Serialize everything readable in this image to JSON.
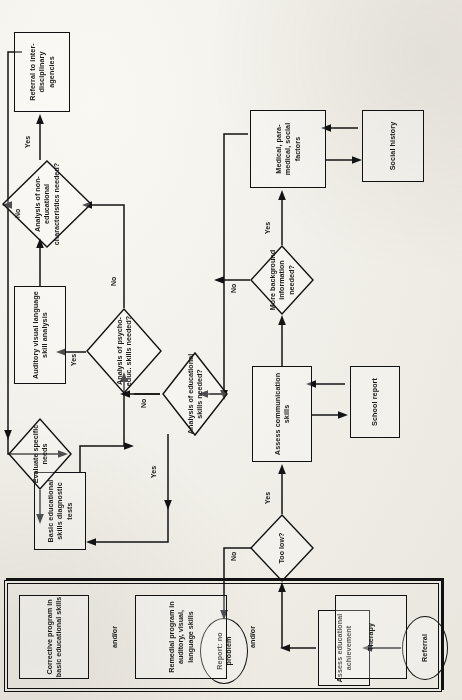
{
  "diagram": {
    "orientation": "rotated-90-ccw",
    "ink_color": "#131313",
    "paper_color": "#f1efe9",
    "nodes": {
      "referral": "Referral",
      "assess_educational_achievement": "Assess educational achievement",
      "too_low": "Too low?",
      "report_no_problem": "Report: no problem",
      "assess_communication_skills": "Assess communication skills",
      "school_report": "School report",
      "more_background_information": "More background information needed?",
      "medical_factors": "Medical, para-medical, social factors",
      "social_history": "Social history",
      "analysis_educational_skills": "Analysis of educational skills needed?",
      "basic_educational_tests": "Basic educational skills diagnostic tests",
      "analysis_psycho_educ": "Analysis of psycho-educ. skills needed?",
      "auditory_visual_language": "Auditory visual language skill analysis",
      "analysis_non_educational": "Analysis of non-educational characteristics needed?",
      "referral_interdisciplinary": "Referral to inter- disciplinary agencies",
      "evaluate_specific_needs": "Evaluate specific needs"
    },
    "program_group": {
      "corrective_program": "Corrective program in basic educational skills",
      "andor_1": "and/or",
      "remedial_program": "Remedial program in auditory, visual, language skills",
      "andor_2": "and/or",
      "therapy": "Therapy"
    },
    "edge_labels": {
      "too_low_no": "No",
      "too_low_yes": "Yes",
      "background_no": "No",
      "background_yes": "Yes",
      "edu_skills_yes": "Yes",
      "edu_skills_no": "No",
      "psycho_yes": "Yes",
      "psycho_no": "No",
      "noneduc_no": "No",
      "noneduc_yes": "Yes"
    }
  }
}
